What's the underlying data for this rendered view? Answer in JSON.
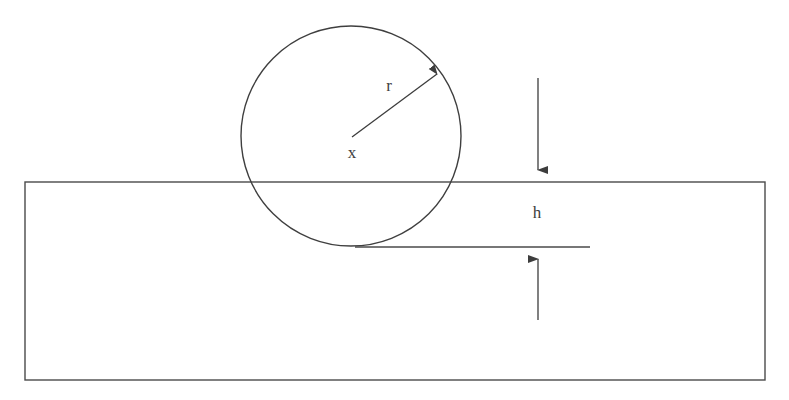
{
  "figure": {
    "type": "technical-diagram",
    "background_color": "#ffffff",
    "stroke_color": "#4a4a4a",
    "text_color": "#3d3d3d",
    "width": 789,
    "height": 400
  },
  "labels": {
    "radius": "r",
    "center": "x",
    "height": "h"
  },
  "geometry": {
    "circle": {
      "center_x": 351,
      "center_y": 136,
      "radius": 110
    },
    "plate": {
      "left": 25,
      "top": 182,
      "right": 765,
      "bottom": 380
    },
    "reference_line": {
      "x_start": 355,
      "x_end": 590,
      "y": 247
    },
    "radius_arrow": {
      "from_x": 352,
      "from_y": 137,
      "to_x": 439,
      "to_y": 73
    },
    "dimension_top_arrow": {
      "x": 538,
      "from_y": 78,
      "to_y": 181
    },
    "dimension_bottom_arrow": {
      "x": 538,
      "from_y": 320,
      "to_y": 248
    }
  },
  "label_positions": {
    "radius": {
      "x": 389,
      "y": 85
    },
    "center": {
      "x": 352,
      "y": 152
    },
    "height": {
      "x": 537,
      "y": 212
    }
  }
}
